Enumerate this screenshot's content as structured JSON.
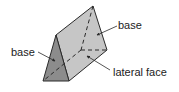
{
  "diagram": {
    "labels": {
      "base_right": "base",
      "base_left": "base",
      "lateral_face": "lateral face"
    },
    "colors": {
      "front_face": "#8c8c8c",
      "lateral_face": "#c6c6c6",
      "side_face": "#b4b4b4",
      "edge": "#2a2a2a",
      "text": "#222222"
    }
  }
}
